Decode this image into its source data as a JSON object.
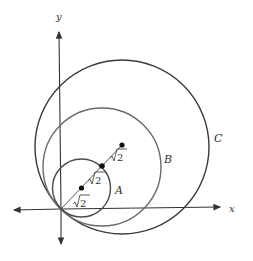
{
  "diagram": {
    "type": "nested tangent circles on coordinate axes",
    "axes": {
      "x_label": "x",
      "y_label": "y"
    },
    "circles": [
      {
        "label": "A",
        "radius_note": "radius = sqrt(2)"
      },
      {
        "label": "B",
        "radius_note": "radius = 2*sqrt(2)"
      },
      {
        "label": "C",
        "radius_note": "radius = 3*sqrt(2)"
      }
    ],
    "segment_labels": [
      "√2",
      "√2",
      "√2"
    ],
    "colors": {
      "stroke": "#3a3a3a",
      "circle_b": "#6a6a6a",
      "text": "#333333"
    }
  }
}
